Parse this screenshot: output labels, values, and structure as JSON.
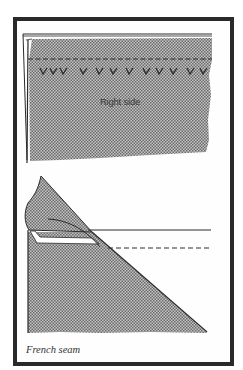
{
  "figure": {
    "caption": "French seam",
    "panels": [
      {
        "name": "top-panel",
        "label": "Right side",
        "elements": [
          "fabric-right-side-shaded",
          "stitch-line-dashed",
          "tack-marks-v"
        ]
      },
      {
        "name": "bottom-panel",
        "elements": [
          "folded-fabric-corner",
          "seam-line-solid",
          "stitch-line-dashed"
        ]
      }
    ],
    "colors": {
      "ink": "#2a2a2a",
      "shade": "#9a9a9a",
      "paper": "#fefefe"
    }
  }
}
